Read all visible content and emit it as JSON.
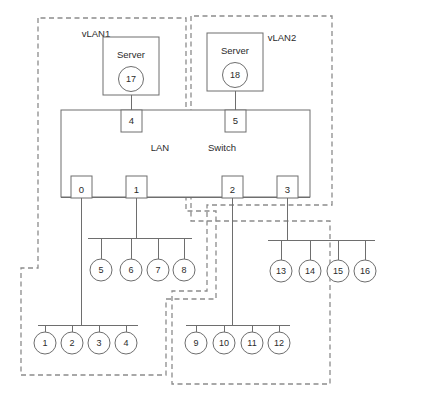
{
  "diagram": {
    "colors": {
      "solid_stroke": "#6e6e6e",
      "dashed_stroke": "#8c8c8c",
      "text": "#2b2b2b",
      "background": "#ffffff"
    },
    "vlans": [
      {
        "id": "vlan1",
        "label": "vLAN1",
        "label_x": 96,
        "label_y": 34
      },
      {
        "id": "vlan2",
        "label": "vLAN2",
        "label_x": 282,
        "label_y": 38
      }
    ],
    "switch": {
      "label_lan": "LAN",
      "label_switch": "Switch",
      "lan_x": 160,
      "lan_y": 148,
      "switch_x": 222,
      "switch_y": 148,
      "x": 61,
      "y": 110,
      "width": 249,
      "height": 87
    },
    "servers": [
      {
        "label": "Server",
        "node": "17",
        "box_x": 103,
        "box_y": 37,
        "box_w": 56,
        "box_h": 58
      },
      {
        "label": "Server",
        "node": "18",
        "box_x": 207,
        "box_y": 33,
        "box_w": 56,
        "box_h": 58
      }
    ],
    "ports": [
      {
        "label": "4",
        "x": 123,
        "y": 110,
        "w": 20,
        "h": 22
      },
      {
        "label": "5",
        "x": 225,
        "y": 110,
        "w": 20,
        "h": 22
      },
      {
        "label": "0",
        "x": 71,
        "y": 180,
        "w": 20,
        "h": 22
      },
      {
        "label": "1",
        "x": 126,
        "y": 180,
        "w": 20,
        "h": 22
      },
      {
        "label": "2",
        "x": 222,
        "y": 180,
        "w": 20,
        "h": 22
      },
      {
        "label": "3",
        "x": 277,
        "y": 180,
        "w": 20,
        "h": 22
      }
    ],
    "node_groups": [
      {
        "id": "group-5-8",
        "nodes": [
          "5",
          "6",
          "7",
          "8"
        ],
        "bar_y": 238,
        "bar_x1": 88,
        "bar_x2": 192,
        "circle_y": 270,
        "circle_r": 11,
        "circle_xs": [
          101,
          131,
          158,
          184
        ],
        "stem_from_port": "1",
        "stem_x": 136
      },
      {
        "id": "group-13-16",
        "nodes": [
          "13",
          "14",
          "15",
          "16"
        ],
        "bar_y": 240,
        "bar_x1": 268,
        "bar_x2": 375,
        "circle_y": 271,
        "circle_r": 11,
        "circle_xs": [
          281,
          310,
          338,
          365
        ],
        "stem_from_port": "3",
        "stem_x": 287
      },
      {
        "id": "group-1-4",
        "nodes": [
          "1",
          "2",
          "3",
          "4"
        ],
        "bar_y": 325,
        "bar_x1": 38,
        "bar_x2": 138,
        "circle_y": 343,
        "circle_r": 11,
        "circle_xs": [
          45,
          72,
          99,
          126
        ],
        "stem_from_port": "0",
        "stem_x": 81
      },
      {
        "id": "group-9-12",
        "nodes": [
          "9",
          "10",
          "11",
          "12"
        ],
        "bar_y": 325,
        "bar_x1": 186,
        "bar_x2": 290,
        "circle_y": 343,
        "circle_r": 11,
        "circle_xs": [
          196,
          224,
          252,
          279
        ],
        "stem_from_port": "2",
        "stem_x": 232
      }
    ],
    "vlan1_path": "M 38,18 L 38,268 L 21,268 L 21,375 L 166,375 L 166,299 L 216,299 L 216,211 L 186,211 L 186,18 Z",
    "vlan2_path": "M 191,16 L 191,221 L 330,221 L 330,384 L 172,384 L 172,291 L 207,291 L 207,205 L 332,205 L 332,16 Z"
  }
}
